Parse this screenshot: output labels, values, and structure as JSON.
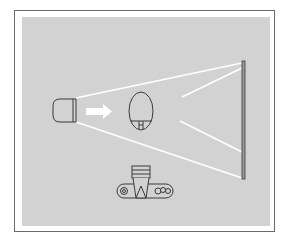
{
  "diagram": {
    "colors": {
      "background": "#ffffff",
      "frame_border": "#6a6a6a",
      "panel": "#d2d2d2",
      "beam": "#ffffff",
      "stroke": "#3a3a3a"
    },
    "elements": [
      {
        "name": "light-source",
        "shape": "rounded-box"
      },
      {
        "name": "direction-arrow",
        "shape": "white-arrow"
      },
      {
        "name": "subject-oval",
        "shape": "oval-with-base"
      },
      {
        "name": "reflector-screen",
        "shape": "vertical-bar"
      },
      {
        "name": "camera",
        "shape": "camera-top-view"
      }
    ],
    "text_labels": []
  }
}
